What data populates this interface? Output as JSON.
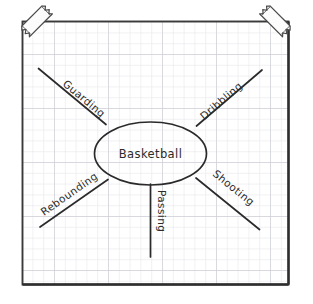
{
  "diagram": {
    "type": "hand-drawn-concept-map",
    "medium": "graph paper with tape at top corners",
    "center": {
      "label": "Basketball",
      "shape": "ellipse"
    },
    "branches": [
      {
        "id": "guarding",
        "label": "Guarding",
        "direction": "upper-left"
      },
      {
        "id": "dribbling",
        "label": "Dribbling",
        "direction": "upper-right"
      },
      {
        "id": "rebounding",
        "label": "Rebounding",
        "direction": "lower-left"
      },
      {
        "id": "shooting",
        "label": "Shooting",
        "direction": "lower-right"
      },
      {
        "id": "passing",
        "label": "Passing",
        "direction": "down"
      }
    ],
    "tape": [
      {
        "id": "tape-top-left",
        "position": "top-left"
      },
      {
        "id": "tape-top-right",
        "position": "top-right"
      }
    ],
    "colors": {
      "ink": "#2b2b2b",
      "paper": "#ffffff",
      "grid_minor": "#e2e2e6",
      "grid_major": "#cfcfd6",
      "border": "#3a3a3a",
      "tape_fill": "#fdfdfd",
      "tape_edge": "#444444"
    }
  }
}
